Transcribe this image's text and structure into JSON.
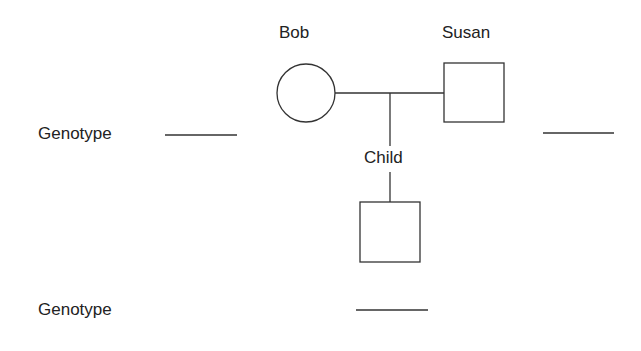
{
  "pedigree": {
    "parents": {
      "female": {
        "name": "Bob",
        "symbol": "circle"
      },
      "male": {
        "name": "Susan",
        "symbol": "square"
      }
    },
    "child": {
      "name": "Child",
      "symbol": "square"
    }
  },
  "genotype_rows": [
    {
      "label": "Genotype",
      "blanks": 2
    },
    {
      "label": "Genotype",
      "blanks": 1
    }
  ],
  "colors": {
    "line": "#333333",
    "text": "#222222",
    "background": "#ffffff"
  }
}
